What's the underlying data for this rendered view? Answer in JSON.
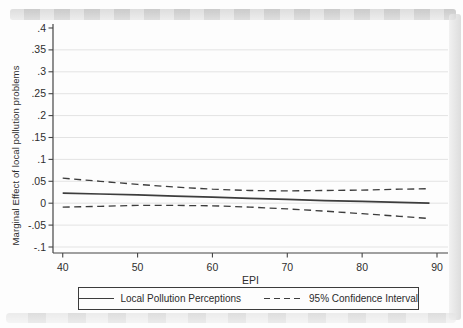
{
  "figure": {
    "background": "#fdfdfd",
    "line_color": "#3d3d3d",
    "grid_color": "#e3e3e3",
    "axis_color": "#454545",
    "text_color": "#2e2e2e"
  },
  "chart_data": {
    "type": "line",
    "title": "",
    "xlabel": "EPI",
    "ylabel": "Marginal Effect of local pollution problems",
    "grid": true,
    "legend_position": "bottom",
    "xlim": [
      38.7,
      91.47
    ],
    "ylim": [
      -0.1137,
      0.4091
    ],
    "x_ticks": [
      {
        "label": "40",
        "value": 40
      },
      {
        "label": "50",
        "value": 50
      },
      {
        "label": "60",
        "value": 60
      },
      {
        "label": "70",
        "value": 70
      },
      {
        "label": "80",
        "value": 80
      },
      {
        "label": "90",
        "value": 90
      }
    ],
    "y_ticks": [
      {
        "label": ".4",
        "value": 0.4,
        "grid": false
      },
      {
        "label": ".35",
        "value": 0.35,
        "grid": true
      },
      {
        "label": ".3",
        "value": 0.3,
        "grid": true
      },
      {
        "label": ".25",
        "value": 0.25,
        "grid": true
      },
      {
        "label": ".2",
        "value": 0.2,
        "grid": true
      },
      {
        "label": ".15",
        "value": 0.15,
        "grid": true
      },
      {
        "label": ".1",
        "value": 0.1,
        "grid": true
      },
      {
        "label": ".05",
        "value": 0.05,
        "grid": true
      },
      {
        "label": "0",
        "value": 0.0,
        "grid": true
      },
      {
        "label": "-.05",
        "value": -0.05,
        "grid": true
      },
      {
        "label": "-.1",
        "value": -0.1,
        "grid": true
      }
    ],
    "x": [
      40,
      45,
      50,
      55,
      60,
      65,
      70,
      75,
      80,
      85,
      89
    ],
    "series": [
      {
        "name": "Local Pollution Perceptions",
        "style": "solid",
        "values": [
          0.023,
          0.021,
          0.019,
          0.016,
          0.014,
          0.011,
          0.009,
          0.006,
          0.004,
          0.002,
          0.0
        ]
      },
      {
        "name": "95% Confidence Interval (upper bound)",
        "style": "dashed",
        "values": [
          0.057,
          0.05,
          0.043,
          0.037,
          0.032,
          0.029,
          0.028,
          0.029,
          0.03,
          0.032,
          0.033
        ]
      },
      {
        "name": "95% Confidence Interval (lower bound)",
        "style": "dashed",
        "values": [
          -0.009,
          -0.007,
          -0.005,
          -0.005,
          -0.006,
          -0.009,
          -0.013,
          -0.018,
          -0.024,
          -0.03,
          -0.035
        ]
      }
    ],
    "legend": [
      {
        "label": "Local Pollution Perceptions",
        "line_style": "solid"
      },
      {
        "label": "95% Confidence Interval",
        "line_style": "dashed"
      }
    ]
  }
}
